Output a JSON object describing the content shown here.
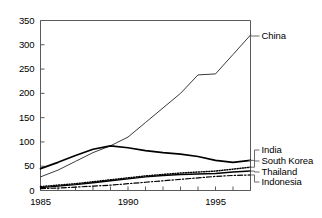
{
  "chart_data": {
    "type": "line",
    "title": "",
    "xlabel": "",
    "ylabel": "",
    "xlim": [
      1985,
      1997
    ],
    "ylim": [
      0,
      350
    ],
    "ytick_values": [
      0,
      50,
      100,
      150,
      200,
      250,
      300,
      350
    ],
    "ytick_labels": [
      "0",
      "50",
      "100",
      "150",
      "200",
      "250",
      "300",
      "350"
    ],
    "xtick_values": [
      1985,
      1986,
      1987,
      1988,
      1989,
      1990,
      1991,
      1992,
      1993,
      1994,
      1995,
      1996,
      1997
    ],
    "xtick_labels_shown": [
      {
        "value": 1985,
        "label": "1985"
      },
      {
        "value": 1990,
        "label": "1990"
      },
      {
        "value": 1995,
        "label": "1995"
      }
    ],
    "grid": false,
    "legend_position": "right-outside-with-leader-lines",
    "x": [
      1985,
      1986,
      1987,
      1988,
      1989,
      1990,
      1991,
      1992,
      1993,
      1994,
      1995,
      1996,
      1997
    ],
    "series": [
      {
        "name": "China",
        "style": "solid",
        "width": 1.0,
        "color": "#3a3a3a",
        "values": [
          28,
          42,
          60,
          78,
          92,
          110,
          140,
          170,
          200,
          238,
          240,
          280,
          320
        ]
      },
      {
        "name": "South Korea",
        "style": "solid",
        "width": 1.7,
        "color": "#000000",
        "values": [
          45,
          58,
          72,
          85,
          92,
          88,
          82,
          78,
          75,
          70,
          62,
          58,
          62
        ]
      },
      {
        "name": "India",
        "style": "dotted",
        "width": 1.5,
        "color": "#000000",
        "values": [
          8,
          11,
          14,
          18,
          22,
          26,
          30,
          33,
          36,
          38,
          40,
          44,
          48
        ]
      },
      {
        "name": "Thailand",
        "style": "solid",
        "width": 1.4,
        "color": "#000000",
        "values": [
          6,
          9,
          12,
          16,
          20,
          24,
          28,
          31,
          33,
          34,
          35,
          38,
          40
        ]
      },
      {
        "name": "Indonesia",
        "style": "dashdot",
        "width": 1.2,
        "color": "#000000",
        "values": [
          4,
          5,
          7,
          9,
          11,
          14,
          17,
          20,
          23,
          26,
          29,
          31,
          32
        ]
      }
    ],
    "series_labels": [
      {
        "name": "China",
        "label": "China"
      },
      {
        "name": "India",
        "label": "India"
      },
      {
        "name": "South Korea",
        "label": "South Korea"
      },
      {
        "name": "Thailand",
        "label": "Thailand"
      },
      {
        "name": "Indonesia",
        "label": "Indonesia"
      }
    ]
  }
}
